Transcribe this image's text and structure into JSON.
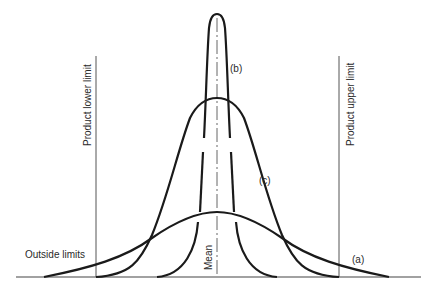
{
  "diagram": {
    "title": "",
    "colors": {
      "curve": "#1a1a1a",
      "limit_line": "#555555",
      "baseline": "#444444",
      "text": "#2a2a2a"
    },
    "labels": {
      "lower_limit": "Product lower limit",
      "upper_limit": "Product upper limit",
      "mean": "Mean",
      "outside_limits": "Outside limits",
      "curve_a": "(a)",
      "curve_b": "(b)",
      "curve_c": "(c)"
    },
    "curves": [
      {
        "id": "a",
        "description": "wide, low distribution extending beyond both product limits"
      },
      {
        "id": "b",
        "description": "narrow, tall distribution well within limits"
      },
      {
        "id": "c",
        "description": "medium distribution spanning exactly the product limits"
      }
    ]
  }
}
